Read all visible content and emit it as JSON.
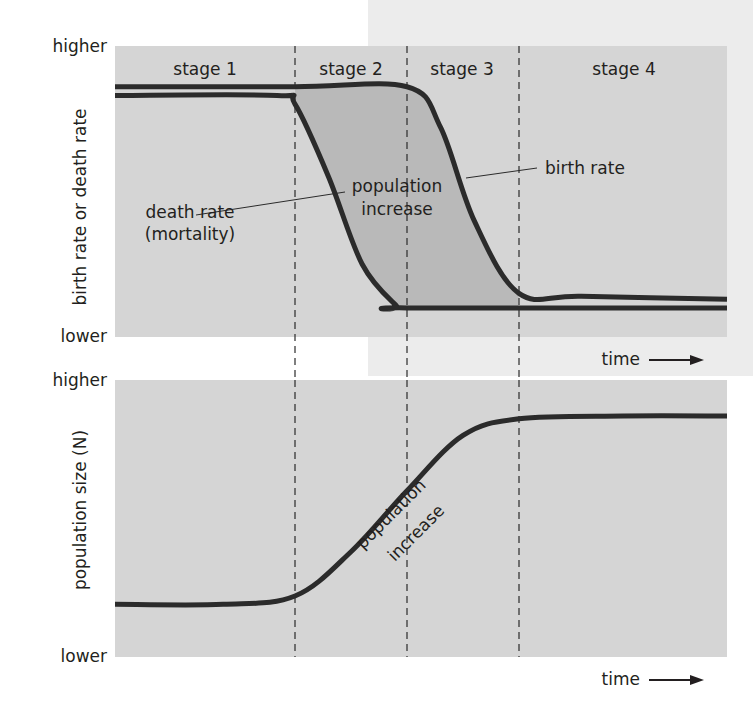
{
  "figure": {
    "top_panel": {
      "y_axis_label": "birth rate or death rate",
      "y_high": "higher",
      "y_low": "lower",
      "x_axis_label": "time",
      "stages": [
        "stage 1",
        "stage 2",
        "stage 3",
        "stage 4"
      ],
      "annotations": {
        "birth_rate": "birth rate",
        "death_rate_line1": "death rate",
        "death_rate_line2": "(mortality)",
        "gap_line1": "population",
        "gap_line2": "increase"
      }
    },
    "bottom_panel": {
      "y_axis_label": "population size (N)",
      "y_high": "higher",
      "y_low": "lower",
      "x_axis_label": "time",
      "annotations": {
        "curve_line1": "population",
        "curve_line2": "increase"
      }
    },
    "colors": {
      "panel": "#d5d5d5",
      "shaded_gap": "#b9b9b9",
      "curve": "#2b2b2b",
      "page_tint": "#ececec"
    }
  },
  "chart_data": [
    {
      "type": "line",
      "title": "Demographic transition: birth and death rates",
      "xlabel": "time",
      "ylabel": "birth rate or death rate",
      "ytick_labels": [
        "lower",
        "higher"
      ],
      "stage_boundaries": [
        1,
        2,
        3
      ],
      "stages": [
        "stage 1",
        "stage 2",
        "stage 3",
        "stage 4"
      ],
      "xlim": [
        0,
        4
      ],
      "ylim": [
        0,
        1
      ],
      "series": [
        {
          "name": "birth rate",
          "x": [
            0,
            1.0,
            2.0,
            2.3,
            2.6,
            3.0,
            3.3,
            4.0
          ],
          "values": [
            0.86,
            0.86,
            0.86,
            0.72,
            0.4,
            0.15,
            0.14,
            0.13
          ]
        },
        {
          "name": "death rate (mortality)",
          "x": [
            0,
            0.9,
            1.0,
            1.3,
            1.6,
            1.9,
            2.0,
            4.0
          ],
          "values": [
            0.83,
            0.83,
            0.8,
            0.55,
            0.25,
            0.11,
            0.1,
            0.1
          ]
        }
      ],
      "shaded_region": "population increase (between birth rate and death rate)"
    },
    {
      "type": "line",
      "title": "Population size over time",
      "xlabel": "time",
      "ylabel": "population size (N)",
      "ytick_labels": [
        "lower",
        "higher"
      ],
      "stage_boundaries": [
        1,
        2,
        3
      ],
      "xlim": [
        0,
        4
      ],
      "ylim": [
        0,
        1
      ],
      "series": [
        {
          "name": "population size",
          "x": [
            0,
            0.6,
            1.0,
            1.5,
            2.0,
            2.5,
            3.0,
            3.5,
            4.0
          ],
          "values": [
            0.19,
            0.19,
            0.22,
            0.38,
            0.6,
            0.8,
            0.86,
            0.87,
            0.87
          ]
        }
      ],
      "annotation": "population increase"
    }
  ]
}
